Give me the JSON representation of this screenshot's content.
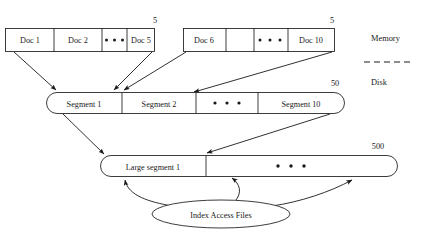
{
  "diagram": {
    "side_labels": {
      "memory": "Memory",
      "disk": "Disk"
    },
    "memory_groups": [
      {
        "name": "memory-group-1",
        "count_label": "5",
        "cells": [
          "Doc 1",
          "Doc 2",
          "• • •",
          "Doc 5"
        ]
      },
      {
        "name": "memory-group-2",
        "count_label": "5",
        "cells": [
          "Doc 6",
          "",
          "• • •",
          "Doc 10"
        ]
      }
    ],
    "segment_row": {
      "count_label": "50",
      "cells": [
        "Segment 1",
        "Segment 2",
        "• • •",
        "Segment 10"
      ]
    },
    "large_segment_row": {
      "count_label": "500",
      "cells": [
        "Large segment 1",
        "• • •"
      ]
    },
    "index_node": {
      "label": "Index Access Files"
    },
    "colors": {
      "stroke": "#1a1a1a",
      "background": "#ffffff"
    }
  }
}
